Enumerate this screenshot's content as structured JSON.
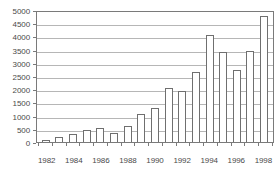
{
  "chart_data": {
    "type": "bar",
    "title": "",
    "subtitle": "",
    "xlabel": "",
    "ylabel": "",
    "categories": [
      "1982",
      "1983",
      "1984",
      "1985",
      "1986",
      "1987",
      "1988",
      "1989",
      "1990",
      "1991",
      "1992",
      "1993",
      "1994",
      "1995",
      "1996",
      "1997",
      "1998"
    ],
    "values": [
      60,
      200,
      290,
      440,
      530,
      340,
      600,
      1060,
      1270,
      2040,
      1930,
      2660,
      4050,
      3410,
      2720,
      3440,
      4790
    ],
    "ylim": [
      0,
      5000
    ],
    "ytick_values": [
      0,
      500,
      1000,
      1500,
      2000,
      2500,
      3000,
      3500,
      4000,
      4500,
      5000
    ],
    "ytick_labels": [
      "0",
      "500",
      "1000",
      "1500",
      "2000",
      "2500",
      "3000",
      "3500",
      "4000",
      "4500",
      "5000"
    ],
    "xtick_labels": [
      "1982",
      "",
      "1984",
      "",
      "1986",
      "",
      "1988",
      "",
      "1990",
      "",
      "1992",
      "",
      "1994",
      "",
      "1996",
      "",
      "1998"
    ],
    "grid": true,
    "grid_axis": "y",
    "legend": "none",
    "bar_fill_color": "#ffffff",
    "bar_edge_color": "#6f6f6f",
    "gridline_color": "#b6b6b6",
    "axis_color": "#7a7a7a",
    "text_color": "#4a4a4a",
    "background_color": "#ffffff"
  }
}
